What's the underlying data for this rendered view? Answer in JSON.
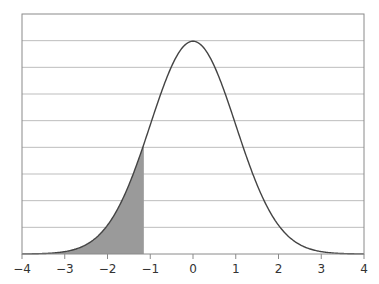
{
  "chart_data": {
    "type": "area",
    "title": "",
    "xlabel": "",
    "ylabel": "",
    "xlim": [
      -4,
      4
    ],
    "ylim": [
      0,
      0.45
    ],
    "grid": true,
    "grid_axis": "y",
    "grid_step": 0.05,
    "x_ticks": [
      -4,
      -3,
      -2,
      -1,
      0,
      1,
      2,
      3,
      4
    ],
    "x_tick_labels": [
      "−4",
      "−3",
      "−2",
      "−1",
      "0",
      "1",
      "2",
      "3",
      "4"
    ],
    "y_tick_labels_visible": false,
    "series": [
      {
        "name": "standard normal pdf",
        "mean": 0,
        "sd": 1,
        "x": [
          -4,
          -3.5,
          -3,
          -2.5,
          -2,
          -1.5,
          -1.15,
          -1,
          -0.5,
          0,
          0.5,
          1,
          1.5,
          2,
          2.5,
          3,
          3.5,
          4
        ],
        "y": [
          0.0001,
          0.0009,
          0.0044,
          0.0175,
          0.054,
          0.1295,
          0.2059,
          0.242,
          0.3521,
          0.3989,
          0.3521,
          0.242,
          0.1295,
          0.054,
          0.0175,
          0.0044,
          0.0009,
          0.0001
        ]
      }
    ],
    "shaded_region": {
      "from": -4,
      "to": -1.15
    },
    "colors": {
      "curve": "#444444",
      "shade": "#9a9a9a",
      "grid": "#bdbdbd",
      "frame": "#8a8a8a"
    }
  }
}
